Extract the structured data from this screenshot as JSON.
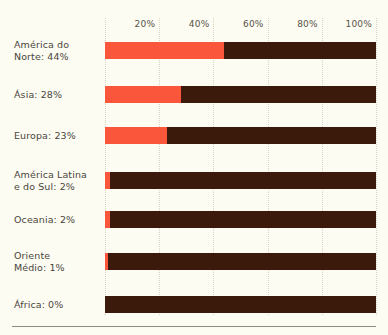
{
  "chart_data": {
    "type": "bar",
    "orientation": "horizontal",
    "stacked": true,
    "title": "",
    "subtitle": "",
    "xlabel": "",
    "ylabel": "",
    "xlim": [
      0,
      100
    ],
    "grid": true,
    "legend": "none",
    "tick_labels": [
      "20%",
      "40%",
      "60%",
      "80%",
      "100%"
    ],
    "tick_values": [
      20,
      40,
      60,
      80,
      100
    ],
    "categories": [
      "América do Norte",
      "Ásia",
      "Europa",
      "América Latina e do Sul",
      "Oceania",
      "Oriente Médio",
      "África"
    ],
    "values": [
      44,
      28,
      23,
      2,
      2,
      1,
      0
    ],
    "series": [
      {
        "name": "share",
        "color": "#f9563c",
        "values": [
          44,
          28,
          23,
          2,
          2,
          1,
          0
        ]
      },
      {
        "name": "remainder",
        "color": "#3c1a0b",
        "values": [
          56,
          72,
          77,
          98,
          98,
          99,
          100
        ]
      }
    ]
  },
  "colors": {
    "background": "#fdfcf3",
    "bar_value": "#f9563c",
    "bar_remainder": "#3c1a0b",
    "gridline": "#d9d4c2",
    "label_text": "#4a453c",
    "tick_text": "#585348",
    "rule": "#8e8a7c"
  },
  "axis": {
    "ticks": [
      {
        "label": "20%",
        "value": 20
      },
      {
        "label": "40%",
        "value": 40
      },
      {
        "label": "60%",
        "value": 60
      },
      {
        "label": "80%",
        "value": 80
      },
      {
        "label": "100%",
        "value": 100
      }
    ]
  },
  "rows": [
    {
      "label": "América do\nNorte: 44%",
      "value": 44,
      "lines": 2,
      "top": 42
    },
    {
      "label": "Ásia: 28%",
      "value": 28,
      "lines": 1,
      "top": 86
    },
    {
      "label": "Europa: 23%",
      "value": 23,
      "lines": 1,
      "top": 127
    },
    {
      "label": "América Latina\ne do Sul: 2%",
      "value": 2,
      "lines": 2,
      "top": 172
    },
    {
      "label": "Oceania: 2%",
      "value": 2,
      "lines": 1,
      "top": 211
    },
    {
      "label": "Oriente\nMédio: 1%",
      "value": 1,
      "lines": 2,
      "top": 253
    },
    {
      "label": "África: 0%",
      "value": 0,
      "lines": 1,
      "top": 296
    }
  ]
}
